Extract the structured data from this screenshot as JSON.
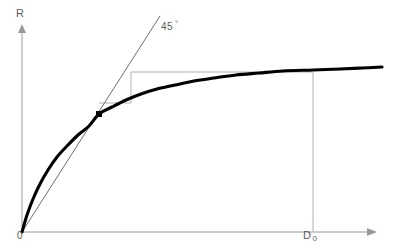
{
  "figure": {
    "labels": {
      "y_axis": "R",
      "x_axis": "",
      "origin": "0",
      "d0_base": "D",
      "d0_sub": "0",
      "angle_value": "45",
      "angle_unit": "°"
    },
    "colors": {
      "background": "#ffffff",
      "curve": "#000000",
      "axis": "#9a9a9a",
      "reference_line": "#6e6e6e",
      "construction_line": "#b0b0b0",
      "marker": "#000000",
      "text": "#5a5a5a"
    }
  },
  "chart_data": {
    "type": "line",
    "xlabel": "",
    "ylabel": "R",
    "xlim": [
      0,
      400
    ],
    "ylim": [
      0,
      250
    ],
    "grid": false,
    "legend": null,
    "axes": {
      "origin_px": [
        22,
        232
      ],
      "y_axis_top_px": [
        22,
        26
      ],
      "x_axis_right_px": [
        375,
        232
      ],
      "y_axis_arrow": true,
      "x_axis_arrow": true
    },
    "series": [
      {
        "name": "response-curve",
        "style": "thick-solid",
        "color": "#000000",
        "width_px": 3.1,
        "points": [
          [
            22,
            232
          ],
          [
            27,
            215
          ],
          [
            33,
            199
          ],
          [
            40,
            184
          ],
          [
            48,
            170
          ],
          [
            57,
            157
          ],
          [
            67,
            146
          ],
          [
            78,
            135
          ],
          [
            89,
            126
          ],
          [
            99,
            114
          ],
          [
            112,
            107
          ],
          [
            126,
            100
          ],
          [
            141,
            94
          ],
          [
            157,
            89
          ],
          [
            175,
            85
          ],
          [
            194,
            81
          ],
          [
            214,
            78
          ],
          [
            236,
            75
          ],
          [
            259,
            73
          ],
          [
            283,
            71
          ],
          [
            313,
            70
          ],
          [
            340,
            69
          ],
          [
            362,
            68
          ],
          [
            382,
            67
          ]
        ]
      },
      {
        "name": "forty-five-degree-line",
        "style": "thin-solid",
        "color": "#6e6e6e",
        "width_px": 1,
        "points": [
          [
            22,
            232
          ],
          [
            160,
            16
          ]
        ]
      }
    ],
    "markers": [
      {
        "name": "tangency-point",
        "shape": "square",
        "color": "#000000",
        "size_px": 6,
        "position_px": [
          99,
          114
        ]
      }
    ],
    "construction_lines": [
      {
        "name": "upper-horizontal-guide",
        "from_px": [
          131,
          72
        ],
        "to_px": [
          313,
          72
        ],
        "color": "#b0b0b0"
      },
      {
        "name": "step-vertical-guide",
        "from_px": [
          131,
          72
        ],
        "to_px": [
          131,
          103
        ],
        "color": "#b0b0b0"
      },
      {
        "name": "step-horizontal-guide",
        "from_px": [
          99,
          103
        ],
        "to_px": [
          131,
          103
        ],
        "color": "#b0b0b0"
      },
      {
        "name": "d0-dropline",
        "from_px": [
          313,
          72
        ],
        "to_px": [
          313,
          232
        ],
        "color": "#b0b0b0"
      }
    ],
    "annotations": [
      {
        "name": "angle-annotation",
        "text": "45 °",
        "position_px": [
          161,
          20
        ]
      },
      {
        "name": "y-axis-label",
        "text": "R",
        "position_px": [
          16,
          7
        ]
      },
      {
        "name": "origin-label",
        "text": "0",
        "position_px": [
          17,
          230
        ]
      },
      {
        "name": "d0-label",
        "text": "D 0",
        "position_px": [
          303,
          229
        ]
      }
    ]
  }
}
